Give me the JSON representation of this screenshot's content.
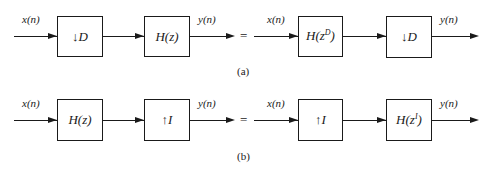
{
  "figure": {
    "panels": [
      {
        "caption": "(a)",
        "left": {
          "input_label": "x(n)",
          "blocks": [
            {
              "arrow": "↓",
              "label": "D",
              "type": "decimator"
            },
            {
              "label": "H(z)",
              "type": "filter"
            }
          ],
          "output_label": "y(n)"
        },
        "equals": "=",
        "right": {
          "input_label": "x(n)",
          "blocks": [
            {
              "base": "H(z",
              "sup": "D",
              "close": ")",
              "type": "filter"
            },
            {
              "arrow": "↓",
              "label": "D",
              "type": "decimator"
            }
          ],
          "output_label": "y(n)"
        }
      },
      {
        "caption": "(b)",
        "left": {
          "input_label": "x(n)",
          "blocks": [
            {
              "label": "H(z)",
              "type": "filter"
            },
            {
              "arrow": "↑",
              "label": "I",
              "type": "interpolator"
            }
          ],
          "output_label": "y(n)"
        },
        "equals": "=",
        "right": {
          "input_label": "x(n)",
          "blocks": [
            {
              "arrow": "↑",
              "label": "I",
              "type": "interpolator"
            },
            {
              "base": "H(z",
              "sup": "I",
              "close": ")",
              "type": "filter"
            }
          ],
          "output_label": "y(n)"
        }
      }
    ]
  }
}
